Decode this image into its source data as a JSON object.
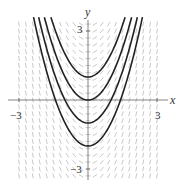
{
  "chart_data": {
    "type": "line",
    "title": "",
    "subtitle": "Slope field for dy/dx = 2x with solution curves y = x^2 + C",
    "xlabel": "x",
    "ylabel": "y",
    "xlim": [
      -3.4,
      3.9
    ],
    "ylim": [
      -3.6,
      3.7
    ],
    "x_ticks": [
      {
        "value": -3,
        "label": "−3"
      },
      {
        "value": 3,
        "label": "3"
      }
    ],
    "y_ticks": [
      {
        "value": 3,
        "label": "3"
      },
      {
        "value": -3,
        "label": "−3"
      }
    ],
    "grid": false,
    "legend": null,
    "slope_field": {
      "equation": "dy/dx = 2x",
      "x_range": [
        -3,
        3
      ],
      "y_range": [
        -3.3,
        3.3
      ],
      "spacing": 0.3,
      "segment_length": 0.22,
      "color": "#b0b0b0"
    },
    "series": [
      {
        "name": "C = 1",
        "C": 1,
        "color": "#222222"
      },
      {
        "name": "C = 0",
        "C": 0,
        "color": "#222222"
      },
      {
        "name": "C = -1",
        "C": -1,
        "color": "#222222"
      },
      {
        "name": "C = -2",
        "C": -2,
        "color": "#222222"
      }
    ]
  },
  "axes": {
    "x_label": "x",
    "y_label": "y",
    "x_min_tick": "−3",
    "x_max_tick": "3",
    "y_max_tick": "3",
    "y_min_tick": "−3",
    "axis_color": "#666666"
  }
}
